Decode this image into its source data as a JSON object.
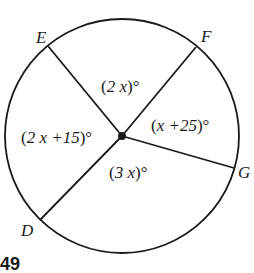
{
  "problem": {
    "number": "49"
  },
  "diagram": {
    "type": "circle with radii",
    "colors": {
      "stroke": "#1a1a1a",
      "background": "#ffffff"
    },
    "points": [
      {
        "label": "E"
      },
      {
        "label": "F"
      },
      {
        "label": "G"
      },
      {
        "label": "D"
      }
    ],
    "angles": [
      {
        "id": "EF",
        "open": "(",
        "expr": "2 x",
        "close": ")°"
      },
      {
        "id": "FG",
        "open": "(",
        "expr": "x +25",
        "close": ")°"
      },
      {
        "id": "GD",
        "open": "(",
        "expr": "3 x",
        "close": ")°"
      },
      {
        "id": "DE",
        "open": "(",
        "expr": "2 x +15",
        "close": ")°"
      }
    ]
  }
}
